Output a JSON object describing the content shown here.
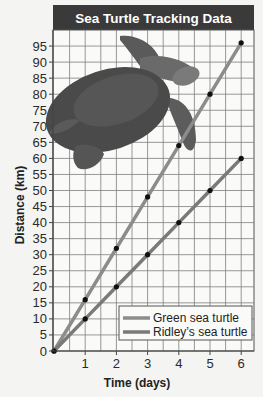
{
  "chart_data": {
    "type": "line",
    "title": "Sea Turtle Tracking Data",
    "xlabel": "Time (days)",
    "ylabel": "Distance (km)",
    "x": [
      0,
      1,
      2,
      3,
      4,
      5,
      6
    ],
    "xticks": [
      1,
      2,
      3,
      4,
      5,
      6
    ],
    "yticks": [
      0,
      5,
      10,
      15,
      20,
      25,
      30,
      35,
      40,
      45,
      50,
      55,
      60,
      65,
      70,
      75,
      80,
      85,
      90,
      95
    ],
    "xlim": [
      0,
      6.4
    ],
    "ylim": [
      0,
      100
    ],
    "grid": true,
    "legend_position": "lower right",
    "series": [
      {
        "name": "Green sea turtle",
        "values": [
          0,
          16,
          32,
          48,
          64,
          80,
          96
        ],
        "color": "#8c8c8c"
      },
      {
        "name": "Ridley’s sea turtle",
        "values": [
          0,
          10,
          20,
          30,
          40,
          50,
          60
        ],
        "color": "#7a7a7a"
      }
    ],
    "annotations": [
      "turtle illustration in upper-left of plot area"
    ]
  },
  "colors": {
    "title_bar": "#3a3a3a",
    "grid": "#7d7d7d",
    "background": "#f4f4f2",
    "point": "#111111"
  }
}
